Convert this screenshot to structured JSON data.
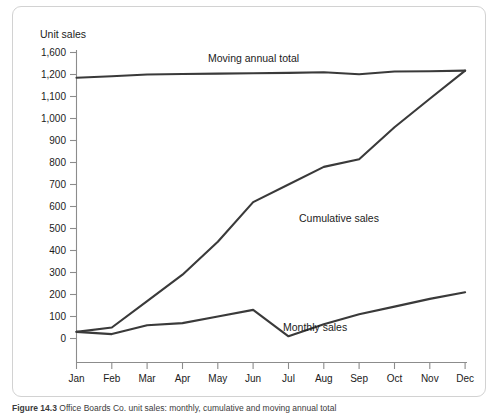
{
  "figure": {
    "caption_number": "Figure 14.3",
    "caption_text": "Office Boards Co. unit sales: monthly, cumulative and moving annual total"
  },
  "chart_data": {
    "type": "line",
    "title": "",
    "subtitle": "",
    "xlabel": "",
    "ylabel": "Unit sales",
    "grid": false,
    "legend_position": "inline-annotations",
    "axis_note": "y-axis is broken: spacing from 1,200 to 1,600 equals one 100-unit step",
    "categories": [
      "Jan",
      "Feb",
      "Mar",
      "Apr",
      "May",
      "Jun",
      "Jul",
      "Aug",
      "Sep",
      "Oct",
      "Nov",
      "Dec"
    ],
    "ytick_labels": [
      "0",
      "100",
      "200",
      "300",
      "400",
      "500",
      "600",
      "700",
      "800",
      "900",
      "1,000",
      "1,100",
      "1,200",
      "1,600"
    ],
    "ytick_values": [
      0,
      100,
      200,
      300,
      400,
      500,
      600,
      700,
      800,
      900,
      1000,
      1100,
      1200,
      1600
    ],
    "ylim": [
      0,
      1600
    ],
    "series": [
      {
        "name": "Monthly sales",
        "label": "Monthly sales",
        "values": [
          30,
          20,
          60,
          70,
          100,
          130,
          10,
          65,
          110,
          145,
          180,
          210
        ]
      },
      {
        "name": "Cumulative sales",
        "label": "Cumulative sales",
        "values": [
          30,
          50,
          170,
          290,
          440,
          620,
          700,
          780,
          815,
          960,
          1090,
          1270
        ]
      },
      {
        "name": "Moving annual total",
        "label": "Moving annual total",
        "values": [
          1185,
          1192,
          1200,
          1208,
          1215,
          1222,
          1230,
          1240,
          1205,
          1255,
          1258,
          1270
        ]
      }
    ],
    "annotations": [
      {
        "text": "Moving annual total",
        "x": 195,
        "y": 55
      },
      {
        "text": "Cumulative sales",
        "x": 286,
        "y": 215
      },
      {
        "text": "Monthly sales",
        "x": 270,
        "y": 324
      }
    ]
  }
}
